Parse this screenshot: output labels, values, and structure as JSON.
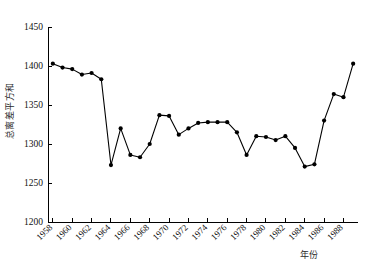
{
  "chart_data": {
    "type": "line",
    "title": "",
    "xlabel": "年份",
    "ylabel": "总离差平方和",
    "ylim": [
      1200,
      1450
    ],
    "ytick_values": [
      1200,
      1250,
      1300,
      1350,
      1400,
      1450
    ],
    "ytick_labels": [
      "1200",
      "1250",
      "1300",
      "1350",
      "1400",
      "1450"
    ],
    "xlim": [
      1957.5,
      1989.5
    ],
    "xtick_values": [
      1958,
      1960,
      1962,
      1964,
      1966,
      1968,
      1970,
      1972,
      1974,
      1976,
      1978,
      1980,
      1982,
      1984,
      1986,
      1988
    ],
    "xtick_labels": [
      "1958",
      "1960",
      "1962",
      "1964",
      "1966",
      "1968",
      "1970",
      "1972",
      "1974",
      "1976",
      "1978",
      "1980",
      "1982",
      "1984",
      "1986",
      "1988"
    ],
    "grid": false,
    "legend": null,
    "marker": "filled-circle",
    "line_color": "#000000",
    "marker_color": "#000000",
    "x": [
      1958,
      1959,
      1960,
      1961,
      1962,
      1963,
      1964,
      1965,
      1966,
      1967,
      1968,
      1969,
      1970,
      1971,
      1972,
      1973,
      1974,
      1975,
      1976,
      1977,
      1978,
      1979,
      1980,
      1981,
      1982,
      1983,
      1984,
      1985,
      1986,
      1987,
      1988,
      1989
    ],
    "values": [
      1403,
      1398,
      1396,
      1389,
      1391,
      1383,
      1273,
      1320,
      1286,
      1283,
      1300,
      1337,
      1336,
      1312,
      1320,
      1327,
      1328,
      1328,
      1328,
      1315,
      1286,
      1310,
      1309,
      1305,
      1310,
      1295,
      1271,
      1274,
      1330,
      1364,
      1360,
      1403
    ],
    "series": [
      {
        "name": "总离差平方和",
        "values": [
          1403,
          1398,
          1396,
          1389,
          1391,
          1383,
          1273,
          1320,
          1286,
          1283,
          1300,
          1337,
          1336,
          1312,
          1320,
          1327,
          1328,
          1328,
          1328,
          1315,
          1286,
          1310,
          1309,
          1305,
          1310,
          1295,
          1271,
          1274,
          1330,
          1364,
          1360,
          1403
        ]
      }
    ]
  },
  "axes": {
    "y_title": "总离差平方和",
    "x_title": "年份"
  }
}
